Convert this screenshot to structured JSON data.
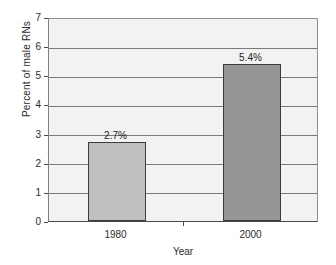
{
  "chart_data": {
    "type": "bar",
    "title": "",
    "categories": [
      "1980",
      "2000"
    ],
    "values": [
      2.7,
      5.4
    ],
    "data_labels": [
      "2.7%",
      "5.4%"
    ],
    "series": [
      {
        "name": "Percent of male RNs",
        "values": [
          2.7,
          5.4
        ]
      }
    ],
    "xlabel": "Year",
    "ylabel": "Percent of male RNs",
    "ylim": [
      0,
      7
    ],
    "ytick_labels": [
      "0",
      "1",
      "2",
      "3",
      "4",
      "5",
      "6",
      "7"
    ],
    "ytick_values": [
      0,
      1,
      2,
      3,
      4,
      5,
      6,
      7
    ],
    "grid": true,
    "legend": false,
    "bar_colors": [
      "#c0c0c0",
      "#969696"
    ],
    "plot_background": "#f2f2f2",
    "gridline_color": "#7a7a7a",
    "bar_border_color": "#3c3c3c"
  }
}
